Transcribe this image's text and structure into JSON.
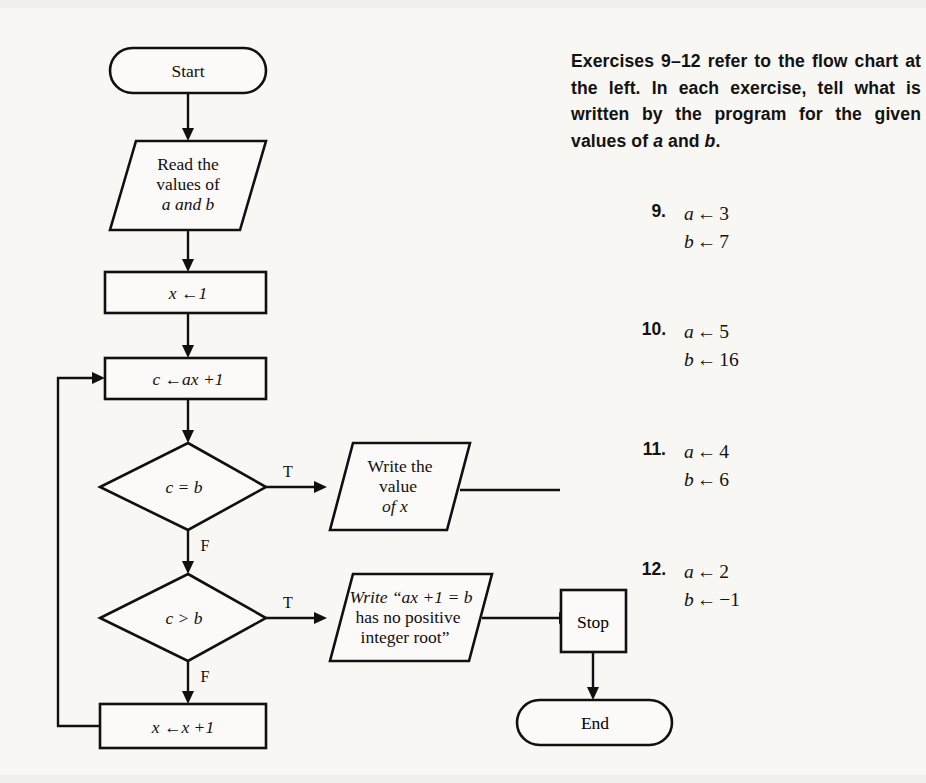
{
  "document": {
    "type": "textbook-exercise-page",
    "background": "#f8f7f4",
    "ink": "#12100e"
  },
  "flowchart": {
    "title": "Flow chart for ax + 1 = b root search",
    "nodes": {
      "start": {
        "shape": "terminator",
        "label": "Start"
      },
      "read": {
        "shape": "parallelogram",
        "line1": "Read the",
        "line2": "values of",
        "line3": "a and b"
      },
      "init_x": {
        "shape": "process",
        "label": "x ←1"
      },
      "compute_c": {
        "shape": "process",
        "label": "c ←ax +1"
      },
      "decide_eq": {
        "shape": "decision",
        "label": "c = b"
      },
      "decide_gt": {
        "shape": "decision",
        "label": "c > b"
      },
      "write_value": {
        "shape": "parallelogram",
        "line1": "Write the",
        "line2": "value",
        "line3": "of x"
      },
      "write_noroot": {
        "shape": "parallelogram",
        "line1": "Write “ax +1 = b",
        "line2": "has no positive",
        "line3": "integer root”"
      },
      "increment_x": {
        "shape": "process",
        "label": "x ←x +1"
      },
      "stop": {
        "shape": "process",
        "label": "Stop"
      },
      "end": {
        "shape": "terminator",
        "label": "End"
      }
    },
    "branch_labels": {
      "eq_true": "T",
      "eq_false": "F",
      "gt_true": "T",
      "gt_false": "F"
    }
  },
  "instructions": {
    "text_parts": [
      "Exercises 9–12 refer to the flow chart at the left.  In each exercise, tell what is written by the program for the given values of ",
      "a",
      " and ",
      "b",
      "."
    ],
    "plain": "Exercises 9–12 refer to the flow chart at the left.  In each exercise, tell what is written by the program for the given values of a and b."
  },
  "exercises": [
    {
      "number": "9.",
      "a_var": "a",
      "a_arrow": "←",
      "a_value": "3",
      "b_var": "b",
      "b_arrow": "←",
      "b_value": "7"
    },
    {
      "number": "10.",
      "a_var": "a",
      "a_arrow": "←",
      "a_value": "5",
      "b_var": "b",
      "b_arrow": "←",
      "b_value": "16"
    },
    {
      "number": "11.",
      "a_var": "a",
      "a_arrow": "←",
      "a_value": "4",
      "b_var": "b",
      "b_arrow": "←",
      "b_value": "6"
    },
    {
      "number": "12.",
      "a_var": "a",
      "a_arrow": "←",
      "a_value": "2",
      "b_var": "b",
      "b_arrow": "←",
      "b_value": "−1"
    }
  ]
}
